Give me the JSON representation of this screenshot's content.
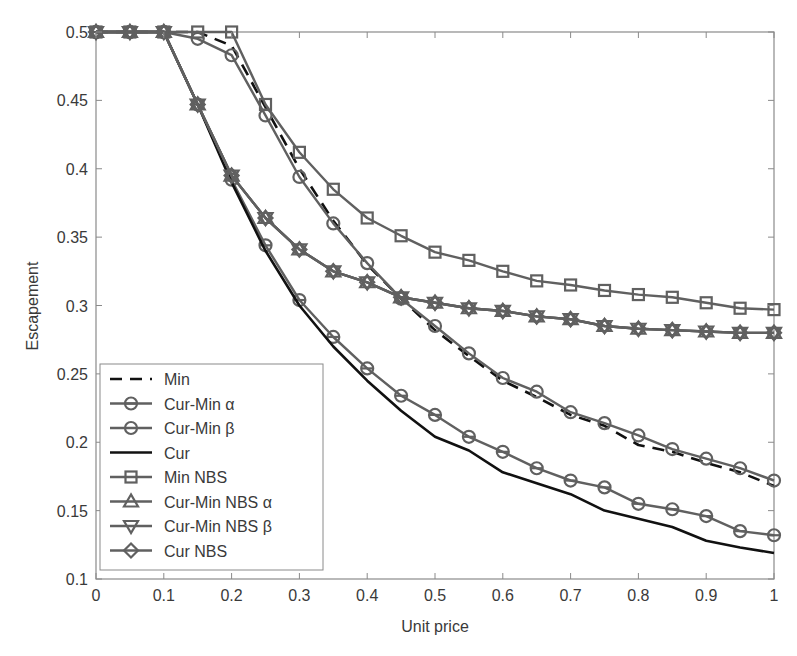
{
  "chart_data": {
    "type": "line",
    "title": "",
    "xlabel": "Unit price",
    "ylabel": "Escapement",
    "xlim": [
      0,
      1
    ],
    "ylim": [
      0.1,
      0.5
    ],
    "xticks": [
      0,
      0.1,
      0.2,
      0.3,
      0.4,
      0.5,
      0.6,
      0.7,
      0.8,
      0.9,
      1
    ],
    "xtick_labels": [
      "0",
      "0.1",
      "0.2",
      "0.3",
      "0.4",
      "0.5",
      "0.6",
      "0.7",
      "0.8",
      "0.9",
      "1"
    ],
    "yticks": [
      0.1,
      0.15,
      0.2,
      0.25,
      0.3,
      0.35,
      0.4,
      0.45,
      0.5
    ],
    "ytick_labels": [
      "0.1",
      "0.15",
      "0.2",
      "0.25",
      "0.3",
      "0.35",
      "0.4",
      "0.45",
      "0.5"
    ],
    "grid": false,
    "legend_position": "lower left",
    "x": [
      0,
      0.05,
      0.1,
      0.15,
      0.2,
      0.25,
      0.3,
      0.35,
      0.4,
      0.45,
      0.5,
      0.55,
      0.6,
      0.65,
      0.7,
      0.75,
      0.8,
      0.85,
      0.9,
      0.95,
      1
    ],
    "series": [
      {
        "name": "Min",
        "style": "dashed",
        "marker": "none",
        "color": "#111111",
        "values": [
          0.5,
          0.5,
          0.5,
          0.5,
          0.49,
          0.445,
          0.4,
          0.362,
          0.33,
          0.305,
          0.282,
          0.263,
          0.245,
          0.233,
          0.22,
          0.212,
          0.198,
          0.193,
          0.185,
          0.178,
          0.168
        ]
      },
      {
        "name": "Cur-Min α",
        "style": "solid",
        "marker": "circle-bar",
        "color": "#606060",
        "values": [
          0.5,
          0.5,
          0.5,
          0.447,
          0.392,
          0.344,
          0.304,
          0.277,
          0.254,
          0.234,
          0.22,
          0.204,
          0.193,
          0.181,
          0.172,
          0.167,
          0.155,
          0.151,
          0.146,
          0.135,
          0.132
        ]
      },
      {
        "name": "Cur-Min β",
        "style": "solid",
        "marker": "circle",
        "color": "#606060",
        "values": [
          0.5,
          0.5,
          0.5,
          0.495,
          0.483,
          0.439,
          0.394,
          0.36,
          0.331,
          0.305,
          0.285,
          0.265,
          0.247,
          0.237,
          0.222,
          0.214,
          0.205,
          0.195,
          0.188,
          0.181,
          0.172
        ]
      },
      {
        "name": "Cur",
        "style": "solid",
        "marker": "none",
        "color": "#111111",
        "values": [
          0.5,
          0.5,
          0.5,
          0.447,
          0.39,
          0.34,
          0.3,
          0.27,
          0.245,
          0.223,
          0.204,
          0.194,
          0.178,
          0.17,
          0.162,
          0.15,
          0.144,
          0.138,
          0.128,
          0.123,
          0.119
        ]
      },
      {
        "name": "Min NBS",
        "style": "solid",
        "marker": "square",
        "color": "#606060",
        "values": [
          0.5,
          0.5,
          0.5,
          0.5,
          0.5,
          0.447,
          0.412,
          0.385,
          0.364,
          0.351,
          0.339,
          0.333,
          0.325,
          0.318,
          0.315,
          0.311,
          0.308,
          0.306,
          0.302,
          0.298,
          0.297
        ]
      },
      {
        "name": "Cur-Min NBS α",
        "style": "solid",
        "marker": "triangle-up",
        "color": "#606060",
        "values": [
          0.5,
          0.5,
          0.5,
          0.447,
          0.395,
          0.364,
          0.341,
          0.325,
          0.317,
          0.306,
          0.302,
          0.298,
          0.296,
          0.292,
          0.29,
          0.285,
          0.283,
          0.282,
          0.281,
          0.28,
          0.28
        ]
      },
      {
        "name": "Cur-Min NBS β",
        "style": "solid",
        "marker": "triangle-down",
        "color": "#606060",
        "values": [
          0.5,
          0.5,
          0.5,
          0.447,
          0.395,
          0.364,
          0.341,
          0.325,
          0.317,
          0.306,
          0.302,
          0.298,
          0.296,
          0.292,
          0.29,
          0.285,
          0.283,
          0.282,
          0.281,
          0.28,
          0.28
        ]
      },
      {
        "name": "Cur NBS",
        "style": "solid",
        "marker": "diamond",
        "color": "#606060",
        "values": [
          0.5,
          0.5,
          0.5,
          0.447,
          0.395,
          0.364,
          0.341,
          0.325,
          0.317,
          0.306,
          0.302,
          0.298,
          0.296,
          0.292,
          0.29,
          0.285,
          0.283,
          0.282,
          0.281,
          0.28,
          0.28
        ]
      }
    ]
  },
  "layout": {
    "plot": {
      "left": 96,
      "right": 774,
      "top": 32,
      "bottom": 579
    },
    "legend": {
      "left": 100,
      "top": 364,
      "width": 223,
      "height": 206,
      "row_height": 24.5
    },
    "colors": {
      "axis": "#8a8a8a",
      "text": "#3a3a3a",
      "marker_gray": "#606060",
      "dark": "#111111"
    }
  }
}
